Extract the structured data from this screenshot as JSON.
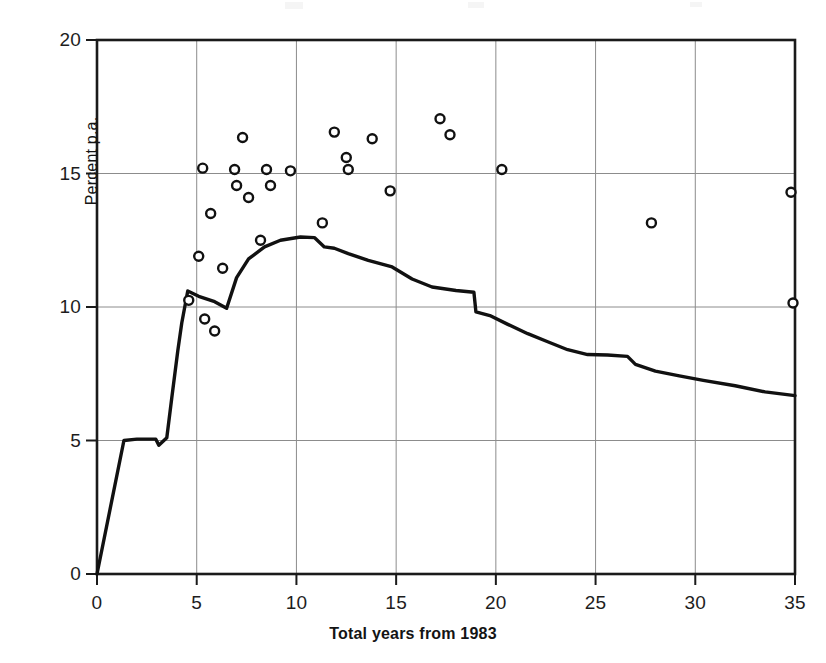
{
  "chart_data": {
    "type": "scatter",
    "title": "",
    "subtitle": "",
    "xlabel": "Total years from 1983",
    "ylabel": "Percent p.a.",
    "xlim": [
      0,
      35
    ],
    "ylim": [
      0,
      20
    ],
    "xticks": [
      0,
      5,
      10,
      15,
      20,
      25,
      30,
      35
    ],
    "xtick_labels": [
      "0",
      "5",
      "10",
      "15",
      "20",
      "25",
      "30",
      "35"
    ],
    "yticks": [
      0,
      5,
      10,
      15,
      20
    ],
    "ytick_labels": [
      "0",
      "5",
      "10",
      "15",
      "20"
    ],
    "grid": "major-xy-interior",
    "legend": "none",
    "series": [
      {
        "name": "cumulative-average-line",
        "type": "line",
        "marker": "none",
        "color": "#111111",
        "line_width": 3.4,
        "points": [
          [
            0.0,
            0.0
          ],
          [
            1.35,
            5.0
          ],
          [
            2.0,
            5.05
          ],
          [
            2.95,
            5.05
          ],
          [
            3.1,
            4.82
          ],
          [
            3.5,
            5.1
          ],
          [
            3.75,
            6.6
          ],
          [
            4.05,
            8.35
          ],
          [
            4.25,
            9.4
          ],
          [
            4.55,
            10.6
          ],
          [
            5.1,
            10.4
          ],
          [
            5.9,
            10.2
          ],
          [
            6.5,
            9.95
          ],
          [
            7.0,
            11.1
          ],
          [
            7.6,
            11.8
          ],
          [
            8.4,
            12.25
          ],
          [
            9.2,
            12.5
          ],
          [
            10.2,
            12.62
          ],
          [
            10.9,
            12.6
          ],
          [
            11.4,
            12.25
          ],
          [
            11.9,
            12.2
          ],
          [
            12.6,
            12.0
          ],
          [
            13.6,
            11.75
          ],
          [
            14.8,
            11.5
          ],
          [
            15.8,
            11.05
          ],
          [
            16.8,
            10.75
          ],
          [
            18.0,
            10.62
          ],
          [
            18.9,
            10.55
          ],
          [
            19.0,
            9.82
          ],
          [
            19.7,
            9.68
          ],
          [
            20.6,
            9.35
          ],
          [
            21.6,
            9.0
          ],
          [
            22.6,
            8.7
          ],
          [
            23.6,
            8.4
          ],
          [
            24.6,
            8.22
          ],
          [
            25.6,
            8.2
          ],
          [
            26.6,
            8.15
          ],
          [
            27.0,
            7.85
          ],
          [
            28.0,
            7.6
          ],
          [
            29.2,
            7.42
          ],
          [
            30.4,
            7.25
          ],
          [
            32.0,
            7.05
          ],
          [
            33.5,
            6.82
          ],
          [
            35.0,
            6.68
          ]
        ]
      },
      {
        "name": "observed-returns-points",
        "type": "scatter",
        "marker": "open-circle",
        "color": "#111111",
        "marker_size": 9,
        "points": [
          [
            4.6,
            10.25
          ],
          [
            5.1,
            11.9
          ],
          [
            5.3,
            15.2
          ],
          [
            5.4,
            9.55
          ],
          [
            5.7,
            13.5
          ],
          [
            5.9,
            9.1
          ],
          [
            6.3,
            11.45
          ],
          [
            6.9,
            15.15
          ],
          [
            7.0,
            14.55
          ],
          [
            7.3,
            16.35
          ],
          [
            7.6,
            14.1
          ],
          [
            8.2,
            12.5
          ],
          [
            8.5,
            15.15
          ],
          [
            8.7,
            14.55
          ],
          [
            9.7,
            15.1
          ],
          [
            11.3,
            13.15
          ],
          [
            11.9,
            16.55
          ],
          [
            12.5,
            15.6
          ],
          [
            12.6,
            15.15
          ],
          [
            13.8,
            16.3
          ],
          [
            14.7,
            14.35
          ],
          [
            17.2,
            17.05
          ],
          [
            17.7,
            16.45
          ],
          [
            20.3,
            15.15
          ],
          [
            27.8,
            13.15
          ],
          [
            34.8,
            14.3
          ],
          [
            34.9,
            10.15
          ]
        ]
      }
    ]
  },
  "axis": {
    "x_title": "Total years from 1983",
    "y_title": "Percent p.a."
  }
}
